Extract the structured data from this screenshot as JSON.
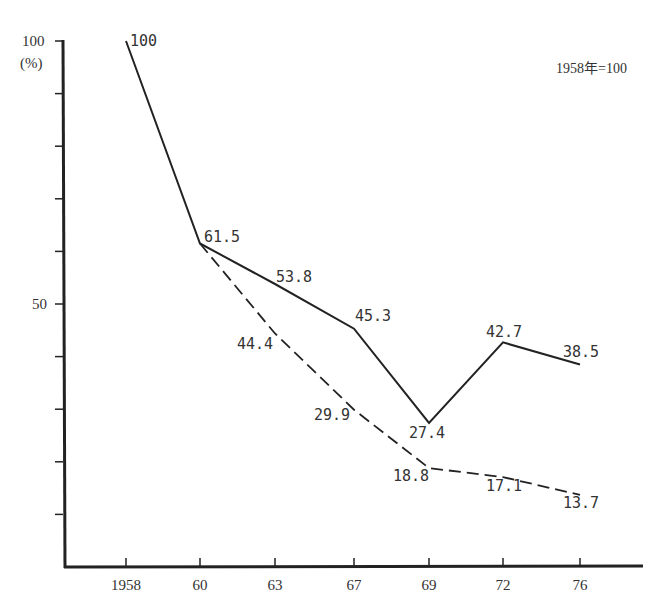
{
  "chart_data": {
    "type": "line",
    "title": "",
    "note": "1958年=100",
    "xlabel": "",
    "ylabel": "(%)",
    "categories": [
      "1958",
      "60",
      "63",
      "67",
      "69",
      "72",
      "76"
    ],
    "ylim": [
      0,
      100
    ],
    "y_ticks": [
      10,
      20,
      30,
      40,
      50,
      60,
      70,
      80,
      90,
      100
    ],
    "y_tick_labels": {
      "100": "100",
      "50": "50"
    },
    "grid": false,
    "legend": null,
    "series": [
      {
        "name": "solid line",
        "style": "solid",
        "values": [
          100,
          61.5,
          53.8,
          45.3,
          27.4,
          42.7,
          38.5
        ],
        "labels": [
          "100",
          "61.5",
          "53.8",
          "45.3",
          "27.4",
          "42.7",
          "38.5"
        ]
      },
      {
        "name": "dashed line",
        "style": "dashed",
        "values": [
          null,
          61.5,
          44.4,
          29.9,
          18.8,
          17.1,
          13.7
        ],
        "labels": [
          "",
          "",
          "44.4",
          "29.9",
          "18.8",
          "17.1",
          "13.7"
        ]
      }
    ]
  }
}
